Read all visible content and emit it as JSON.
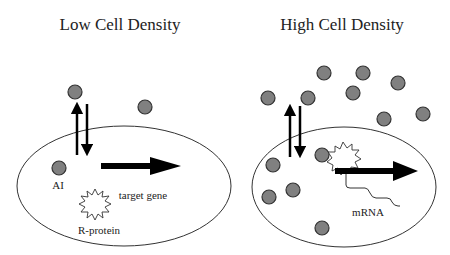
{
  "panels": [
    {
      "title": "Low Cell Density",
      "labels": {
        "ai": "AI",
        "target_gene": "target gene",
        "r_protein": "R-protein"
      }
    },
    {
      "title": "High Cell Density",
      "labels": {
        "mrna": "mRNA"
      }
    }
  ],
  "colors": {
    "molecule_fill": "#808080",
    "outline": "#333333",
    "arrow": "#000000",
    "background": "#ffffff"
  }
}
